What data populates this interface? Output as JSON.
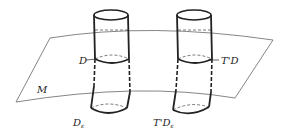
{
  "labels": {
    "M": "M",
    "D": "D",
    "D_eps": "D",
    "D_eps_sub": "ε",
    "TD": "T'D",
    "TD_eps": "T'D",
    "TD_eps_sub": "ε"
  },
  "colors": {
    "stroke": "#222222",
    "surface": "#555555",
    "background": "#ffffff"
  }
}
